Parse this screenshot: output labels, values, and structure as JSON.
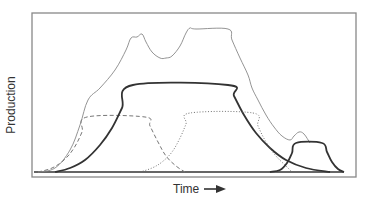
{
  "chart_data": {
    "type": "line",
    "title": "",
    "xlabel": "Time",
    "ylabel": "Production",
    "x_axis_arrow": true,
    "grid": false,
    "legend": null,
    "tick_labels": {
      "x": [],
      "y": []
    },
    "series": [
      {
        "name": "total (envelope)",
        "style": "thin gray solid",
        "points": [
          [
            38,
            172
          ],
          [
            55,
            168
          ],
          [
            70,
            150
          ],
          [
            80,
            125
          ],
          [
            88,
            100
          ],
          [
            100,
            88
          ],
          [
            115,
            70
          ],
          [
            126,
            50
          ],
          [
            131,
            38
          ],
          [
            137,
            37
          ],
          [
            142,
            34
          ],
          [
            146,
            42
          ],
          [
            152,
            52
          ],
          [
            160,
            58
          ],
          [
            166,
            58
          ],
          [
            172,
            56
          ],
          [
            180,
            46
          ],
          [
            186,
            33
          ],
          [
            190,
            28
          ],
          [
            196,
            29
          ],
          [
            228,
            29
          ],
          [
            232,
            40
          ],
          [
            240,
            58
          ],
          [
            248,
            75
          ],
          [
            252,
            88
          ],
          [
            258,
            100
          ],
          [
            266,
            115
          ],
          [
            274,
            127
          ],
          [
            282,
            136
          ],
          [
            290,
            140
          ],
          [
            294,
            136
          ],
          [
            299,
            132
          ],
          [
            304,
            134
          ],
          [
            310,
            143
          ]
        ]
      },
      {
        "name": "curve A",
        "style": "dashed gray",
        "points": [
          [
            38,
            172
          ],
          [
            52,
            168
          ],
          [
            64,
            160
          ],
          [
            74,
            148
          ],
          [
            82,
            132
          ],
          [
            87,
            117
          ],
          [
            145,
            117
          ],
          [
            150,
            126
          ],
          [
            158,
            142
          ],
          [
            166,
            156
          ],
          [
            176,
            166
          ],
          [
            185,
            172
          ]
        ]
      },
      {
        "name": "curve B",
        "style": "thick dark solid",
        "points": [
          [
            55,
            172
          ],
          [
            70,
            168
          ],
          [
            85,
            160
          ],
          [
            100,
            145
          ],
          [
            112,
            128
          ],
          [
            122,
            108
          ],
          [
            133,
            85
          ],
          [
            228,
            85
          ],
          [
            234,
            96
          ],
          [
            244,
            115
          ],
          [
            256,
            133
          ],
          [
            270,
            148
          ],
          [
            286,
            160
          ],
          [
            306,
            168
          ],
          [
            330,
            172
          ]
        ]
      },
      {
        "name": "curve C",
        "style": "dotted gray",
        "points": [
          [
            140,
            172
          ],
          [
            152,
            168
          ],
          [
            162,
            162
          ],
          [
            172,
            152
          ],
          [
            180,
            138
          ],
          [
            186,
            124
          ],
          [
            190,
            113
          ],
          [
            253,
            113
          ],
          [
            258,
            126
          ],
          [
            266,
            142
          ],
          [
            276,
            156
          ],
          [
            286,
            166
          ],
          [
            292,
            172
          ]
        ]
      },
      {
        "name": "curve D",
        "style": "thick dark solid",
        "points": [
          [
            270,
            172
          ],
          [
            280,
            170
          ],
          [
            287,
            163
          ],
          [
            292,
            153
          ],
          [
            296,
            143
          ],
          [
            322,
            143
          ],
          [
            327,
            152
          ],
          [
            332,
            162
          ],
          [
            338,
            169
          ],
          [
            344,
            172
          ]
        ]
      }
    ],
    "axis_range_px": {
      "x": [
        32,
        356
      ],
      "y": [
        13,
        177
      ]
    },
    "baseline_px": 172
  },
  "labels": {
    "y_axis": "Production",
    "x_axis": "Time"
  },
  "colors": {
    "frame": "#777777",
    "envelope": "#888888",
    "dashed": "#777777",
    "thick": "#333333",
    "dotted": "#666666",
    "text": "#333333"
  }
}
